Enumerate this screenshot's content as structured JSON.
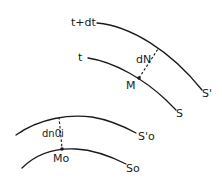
{
  "diagram": {
    "upper_group": {
      "curve_t_dt": {
        "label_start": "t+dt",
        "label_end": "S'"
      },
      "curve_t": {
        "label_start": "t",
        "label_end": "S"
      },
      "point": {
        "label": "M"
      },
      "normal_segment": {
        "label": "dN"
      }
    },
    "lower_group": {
      "curve_s0_prime": {
        "label_end": "S'o"
      },
      "curve_s0": {
        "label_end": "So"
      },
      "point": {
        "label": "Mo"
      },
      "normal_segment": {
        "label": "dn0i"
      }
    },
    "colors": {
      "ink": "#1a1a1a",
      "background": "#ffffff"
    }
  }
}
